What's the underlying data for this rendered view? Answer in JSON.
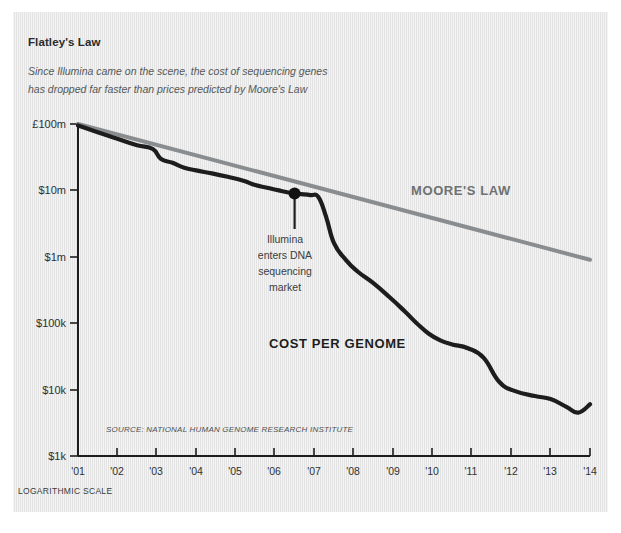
{
  "panel": {
    "background_color": "#e6e6e6",
    "title": "Flatley's Law",
    "subtitle_line1": "Since Illumina came on the scene, the cost of sequencing genes",
    "subtitle_line2": "has dropped far faster than prices predicted by Moore's Law",
    "footnote": "LOGARITHMIC SCALE",
    "source": "SOURCE: NATIONAL HUMAN GENOME RESEARCH INSTITUTE"
  },
  "annotation": {
    "line1": "Illumina",
    "line2": "enters DNA",
    "line3": "sequencing",
    "line4": "market",
    "marker_year": 2006.5,
    "marker_value": 9000000
  },
  "labels": {
    "moores_law": "MOORE'S LAW",
    "cost_per_genome": "COST PER GENOME"
  },
  "colors": {
    "cost_line": "#1d1d1d",
    "moores_line": "#8a8d8f",
    "axis": "#1d1d1d",
    "text": "#2e3133",
    "panel": "#e6e6e6"
  },
  "chart_data": {
    "type": "line",
    "title": "Flatley's Law",
    "subtitle": "Since Illumina came on the scene, the cost of sequencing genes has dropped far faster than prices predicted by Moore's Law",
    "xlabel": "",
    "ylabel": "",
    "yscale": "log",
    "ylim": [
      1000,
      100000000
    ],
    "xlim": [
      2001,
      2014
    ],
    "grid": false,
    "legend": "inline-labels",
    "ytick_labels": [
      "£100m",
      "$10m",
      "$1m",
      "$100k",
      "$10k",
      "$1k"
    ],
    "ytick_values": [
      100000000,
      10000000,
      1000000,
      100000,
      10000,
      1000
    ],
    "xtick_labels": [
      "'01",
      "'02",
      "'03",
      "'04",
      "'05",
      "'06",
      "'07",
      "'08",
      "'09",
      "'10",
      "'11",
      "'12",
      "'13",
      "'14"
    ],
    "xtick_values": [
      2001,
      2002,
      2003,
      2004,
      2005,
      2006,
      2007,
      2008,
      2009,
      2010,
      2011,
      2012,
      2013,
      2014
    ],
    "series": [
      {
        "name": "COST PER GENOME",
        "color": "#1d1d1d",
        "x": [
          2001,
          2001.5,
          2002,
          2002.5,
          2002.9,
          2003.1,
          2003.4,
          2003.7,
          2004,
          2004.4,
          2004.8,
          2005.2,
          2005.5,
          2005.8,
          2006.1,
          2006.5,
          2006.9,
          2007.1,
          2007.3,
          2007.5,
          2007.8,
          2008.1,
          2008.5,
          2008.9,
          2009.3,
          2009.6,
          2009.9,
          2010.2,
          2010.5,
          2010.9,
          2011.3,
          2011.7,
          2012.1,
          2012.6,
          2013.0,
          2013.4,
          2013.7,
          2014.0
        ],
        "y": [
          95000000,
          75000000,
          60000000,
          48000000,
          42000000,
          30000000,
          26000000,
          22000000,
          20000000,
          18000000,
          16000000,
          14000000,
          12000000,
          11000000,
          10000000,
          9000000,
          8500000,
          8000000,
          4000000,
          1600000,
          900000,
          600000,
          400000,
          250000,
          150000,
          100000,
          70000,
          55000,
          48000,
          42000,
          30000,
          13000,
          9500,
          8000,
          7200,
          5500,
          4500,
          6000
        ]
      },
      {
        "name": "MOORE'S LAW",
        "color": "#8a8d8f",
        "x": [
          2001,
          2014
        ],
        "y": [
          100000000,
          900000
        ]
      }
    ]
  }
}
